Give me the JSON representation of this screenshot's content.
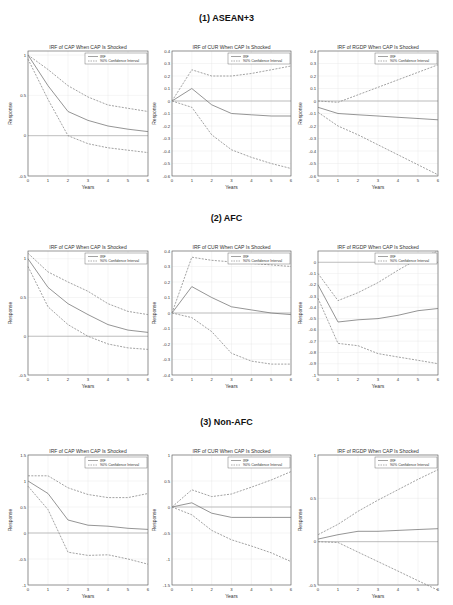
{
  "sections": [
    {
      "title": "(1) ASEAN+3"
    },
    {
      "title": "(2) AFC"
    },
    {
      "title": "(3) Non-AFC"
    }
  ],
  "legend": {
    "irf": "IRF",
    "ci": "90% Confidence Interval"
  },
  "colors": {
    "irf": "#7a7a7a",
    "ci": "#8a8a8a",
    "axis": "#555555",
    "grid": "#e6e6e6",
    "zero": "#9a9a9a"
  },
  "chart_data": [
    {
      "type": "line",
      "section": "(1) ASEAN+3",
      "title": "IRF of CAP When CAP Is Shocked",
      "xlabel": "Years",
      "ylabel": "Response",
      "x": [
        0,
        1,
        2,
        3,
        4,
        5,
        6
      ],
      "ylim": [
        -0.5,
        1.05
      ],
      "yticks": [
        -0.5,
        0,
        0.5,
        1
      ],
      "series": [
        {
          "name": "IRF",
          "values": [
            1.0,
            0.62,
            0.3,
            0.19,
            0.12,
            0.08,
            0.05
          ]
        },
        {
          "name": "90% CI upper",
          "values": [
            1.0,
            0.82,
            0.62,
            0.48,
            0.38,
            0.34,
            0.3
          ]
        },
        {
          "name": "90% CI lower",
          "values": [
            0.95,
            0.45,
            0.0,
            -0.1,
            -0.15,
            -0.18,
            -0.21
          ]
        }
      ]
    },
    {
      "type": "line",
      "section": "(1) ASEAN+3",
      "title": "IRF of CUR When CAP Is Shocked",
      "xlabel": "Years",
      "ylabel": "Response",
      "x": [
        0,
        1,
        2,
        3,
        4,
        5,
        6
      ],
      "ylim": [
        -0.6,
        0.4
      ],
      "yticks": [
        -0.6,
        -0.5,
        -0.4,
        -0.3,
        -0.2,
        -0.1,
        0,
        0.1,
        0.2,
        0.3,
        0.4
      ],
      "series": [
        {
          "name": "IRF",
          "values": [
            0.0,
            0.1,
            -0.03,
            -0.1,
            -0.11,
            -0.12,
            -0.12
          ]
        },
        {
          "name": "90% CI upper",
          "values": [
            0.0,
            0.25,
            0.2,
            0.2,
            0.22,
            0.25,
            0.28
          ]
        },
        {
          "name": "90% CI lower",
          "values": [
            0.0,
            -0.05,
            -0.27,
            -0.39,
            -0.45,
            -0.5,
            -0.54
          ]
        }
      ]
    },
    {
      "type": "line",
      "section": "(1) ASEAN+3",
      "title": "IRF of RGDP When CAP Is Shocked",
      "xlabel": "Years",
      "ylabel": "Response",
      "x": [
        0,
        1,
        2,
        3,
        4,
        5,
        6
      ],
      "ylim": [
        -0.6,
        0.4
      ],
      "yticks": [
        -0.6,
        -0.5,
        -0.4,
        -0.3,
        -0.2,
        -0.1,
        0,
        0.1,
        0.2,
        0.3,
        0.4
      ],
      "series": [
        {
          "name": "IRF",
          "values": [
            -0.05,
            -0.1,
            -0.11,
            -0.12,
            -0.13,
            -0.14,
            -0.15
          ]
        },
        {
          "name": "90% CI upper",
          "values": [
            0.0,
            -0.01,
            0.05,
            0.11,
            0.17,
            0.23,
            0.29
          ]
        },
        {
          "name": "90% CI lower",
          "values": [
            -0.09,
            -0.2,
            -0.27,
            -0.35,
            -0.43,
            -0.51,
            -0.59
          ]
        }
      ]
    },
    {
      "type": "line",
      "section": "(2) AFC",
      "title": "IRF of CAP When CAP Is Shocked",
      "xlabel": "Years",
      "ylabel": "Response",
      "x": [
        0,
        1,
        2,
        3,
        4,
        5,
        6
      ],
      "ylim": [
        -0.5,
        1.1
      ],
      "yticks": [
        -0.5,
        0,
        0.5,
        1
      ],
      "series": [
        {
          "name": "IRF",
          "values": [
            1.0,
            0.63,
            0.42,
            0.28,
            0.15,
            0.08,
            0.05
          ]
        },
        {
          "name": "90% CI upper",
          "values": [
            1.07,
            0.83,
            0.7,
            0.58,
            0.42,
            0.32,
            0.28
          ]
        },
        {
          "name": "90% CI lower",
          "values": [
            0.9,
            0.38,
            0.15,
            0.0,
            -0.1,
            -0.15,
            -0.17
          ]
        }
      ]
    },
    {
      "type": "line",
      "section": "(2) AFC",
      "title": "IRF of CUR When CAP Is Shocked",
      "xlabel": "Years",
      "ylabel": "Response",
      "x": [
        0,
        1,
        2,
        3,
        4,
        5,
        6
      ],
      "ylim": [
        -0.4,
        0.4
      ],
      "yticks": [
        -0.4,
        -0.3,
        -0.2,
        -0.1,
        0,
        0.1,
        0.2,
        0.3,
        0.4
      ],
      "series": [
        {
          "name": "IRF",
          "values": [
            0.0,
            0.17,
            0.1,
            0.04,
            0.02,
            0.0,
            -0.01
          ]
        },
        {
          "name": "90% CI upper",
          "values": [
            0.0,
            0.36,
            0.34,
            0.33,
            0.32,
            0.31,
            0.3
          ]
        },
        {
          "name": "90% CI lower",
          "values": [
            0.0,
            -0.03,
            -0.12,
            -0.26,
            -0.31,
            -0.33,
            -0.33
          ]
        }
      ]
    },
    {
      "type": "line",
      "section": "(2) AFC",
      "title": "IRF of RGDP When CAP Is Shocked",
      "xlabel": "Years",
      "ylabel": "Response",
      "x": [
        0,
        1,
        2,
        3,
        4,
        5,
        6
      ],
      "ylim": [
        -1.0,
        0.1
      ],
      "yticks": [
        -1,
        -0.9,
        -0.8,
        -0.7,
        -0.6,
        -0.5,
        -0.4,
        -0.3,
        -0.2,
        -0.1,
        0
      ],
      "series": [
        {
          "name": "IRF",
          "values": [
            -0.2,
            -0.53,
            -0.51,
            -0.5,
            -0.47,
            -0.43,
            -0.41
          ]
        },
        {
          "name": "90% CI upper",
          "values": [
            -0.1,
            -0.34,
            -0.27,
            -0.18,
            -0.07,
            0.03,
            0.1
          ]
        },
        {
          "name": "90% CI lower",
          "values": [
            -0.32,
            -0.72,
            -0.74,
            -0.81,
            -0.84,
            -0.87,
            -0.9
          ]
        }
      ]
    },
    {
      "type": "line",
      "section": "(3) Non-AFC",
      "title": "IRF of CAP When CAP Is Shocked",
      "xlabel": "Years",
      "ylabel": "Response",
      "x": [
        0,
        1,
        2,
        3,
        4,
        5,
        6
      ],
      "ylim": [
        -1.0,
        1.5
      ],
      "yticks": [
        -1,
        -0.5,
        0,
        0.5,
        1,
        1.5
      ],
      "series": [
        {
          "name": "IRF",
          "values": [
            1.0,
            0.76,
            0.25,
            0.15,
            0.13,
            0.09,
            0.07
          ]
        },
        {
          "name": "90% CI upper",
          "values": [
            1.1,
            1.1,
            0.87,
            0.74,
            0.68,
            0.68,
            0.76
          ]
        },
        {
          "name": "90% CI lower",
          "values": [
            0.9,
            0.45,
            -0.37,
            -0.43,
            -0.42,
            -0.5,
            -0.6
          ]
        }
      ]
    },
    {
      "type": "line",
      "section": "(3) Non-AFC",
      "title": "IRF of CUR When CAP Is Shocked",
      "xlabel": "Years",
      "ylabel": "Response",
      "x": [
        0,
        1,
        2,
        3,
        4,
        5,
        6
      ],
      "ylim": [
        -1.5,
        1.0
      ],
      "yticks": [
        -1.5,
        -1,
        -0.5,
        0,
        0.5,
        1
      ],
      "series": [
        {
          "name": "IRF",
          "values": [
            0.0,
            0.08,
            -0.12,
            -0.2,
            -0.2,
            -0.2,
            -0.2
          ]
        },
        {
          "name": "90% CI upper",
          "values": [
            0.0,
            0.33,
            0.2,
            0.25,
            0.38,
            0.52,
            0.68
          ]
        },
        {
          "name": "90% CI lower",
          "values": [
            0.0,
            -0.15,
            -0.45,
            -0.63,
            -0.75,
            -0.88,
            -1.05
          ]
        }
      ]
    },
    {
      "type": "line",
      "section": "(3) Non-AFC",
      "title": "IRF of RGDP When CAP Is Shocked",
      "xlabel": "Years",
      "ylabel": "Response",
      "x": [
        0,
        1,
        2,
        3,
        4,
        5,
        6
      ],
      "ylim": [
        -0.5,
        1.0
      ],
      "yticks": [
        -0.5,
        0,
        0.5,
        1
      ],
      "series": [
        {
          "name": "IRF",
          "values": [
            0.03,
            0.08,
            0.12,
            0.12,
            0.13,
            0.14,
            0.15
          ]
        },
        {
          "name": "90% CI upper",
          "values": [
            0.08,
            0.2,
            0.35,
            0.48,
            0.6,
            0.72,
            0.83
          ]
        },
        {
          "name": "90% CI lower",
          "values": [
            0.0,
            -0.01,
            -0.12,
            -0.23,
            -0.34,
            -0.45,
            -0.56
          ]
        }
      ]
    }
  ]
}
